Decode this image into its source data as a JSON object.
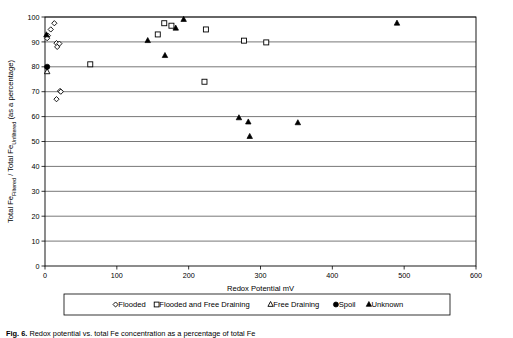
{
  "figure": {
    "caption_prefix": "Fig. 6.",
    "caption_rest": "Redox potential vs. total Fe concentration as a percentage of total Fe"
  },
  "chart_data": {
    "type": "scatter",
    "title": "",
    "xlabel": "Redox Potential mV",
    "ylabel": "Total FeFiltered / Total FeUnfiltered (as a percentage)",
    "ylabel_main_1": "Total Fe",
    "ylabel_sub_1": "Filtered",
    "ylabel_main_2": " / Total Fe",
    "ylabel_sub_2": "Unfiltered",
    "ylabel_main_3": " (as a percentage)",
    "xlim": [
      0,
      600
    ],
    "ylim": [
      0,
      100
    ],
    "xticks": [
      0,
      100,
      200,
      300,
      400,
      500,
      600
    ],
    "yticks": [
      0,
      10,
      20,
      30,
      40,
      50,
      60,
      70,
      80,
      90,
      100
    ],
    "grid": "horizontal",
    "legend_position": "below-axis",
    "series": [
      {
        "name": "Flooded",
        "marker": "open-diamond",
        "color": "#000000",
        "points": [
          [
            4,
            92.5
          ],
          [
            8,
            95.0
          ],
          [
            13,
            97.5
          ],
          [
            16,
            89.5
          ],
          [
            17,
            88.0
          ],
          [
            20,
            89.3
          ],
          [
            21,
            70.3
          ],
          [
            22,
            70.0
          ],
          [
            16,
            67.0
          ],
          [
            3,
            91.5
          ]
        ]
      },
      {
        "name": "Flooded and Free Draining",
        "marker": "open-square",
        "color": "#000000",
        "points": [
          [
            63,
            81.0
          ],
          [
            157,
            93.0
          ],
          [
            166,
            97.5
          ],
          [
            176,
            96.5
          ],
          [
            224,
            95.0
          ],
          [
            277,
            90.5
          ],
          [
            308,
            89.8
          ],
          [
            222,
            74.0
          ]
        ]
      },
      {
        "name": "Free Draining",
        "marker": "open-triangle",
        "color": "#000000",
        "points": [
          [
            3,
            78.0
          ]
        ]
      },
      {
        "name": "Spoil",
        "marker": "filled-circle",
        "color": "#000000",
        "points": [
          [
            3,
            80.0
          ]
        ]
      },
      {
        "name": "Unknown",
        "marker": "filled-triangle",
        "color": "#000000",
        "points": [
          [
            2,
            92.8
          ],
          [
            143,
            90.5
          ],
          [
            182,
            95.5
          ],
          [
            193,
            99.0
          ],
          [
            167,
            84.5
          ],
          [
            270,
            59.5
          ],
          [
            283,
            57.8
          ],
          [
            285,
            52.0
          ],
          [
            352,
            57.5
          ],
          [
            490,
            97.5
          ]
        ]
      }
    ]
  },
  "legend": {
    "items": [
      {
        "label": "Flooded",
        "marker": "open-diamond"
      },
      {
        "label": "Flooded and Free Draining",
        "marker": "open-square"
      },
      {
        "label": "Free Draining",
        "marker": "open-triangle"
      },
      {
        "label": "Spoil",
        "marker": "filled-circle"
      },
      {
        "label": "Unknown",
        "marker": "filled-triangle"
      }
    ]
  }
}
